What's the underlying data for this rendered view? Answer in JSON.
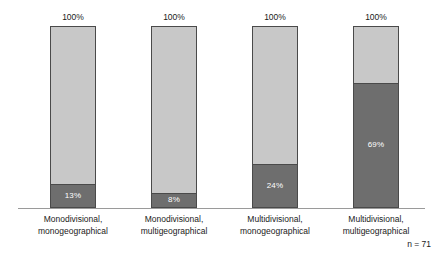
{
  "chart_data": {
    "type": "bar",
    "subtype": "stacked-100-percent",
    "title": "",
    "subtitle": "",
    "xlabel": "",
    "ylabel": "",
    "ylim": [
      0,
      100
    ],
    "grid": false,
    "legend": false,
    "legend_position": "none",
    "orientation": "vertical",
    "categories": [
      "Monodivisional, monogeographical",
      "Monodivisional, multigeographical",
      "Multidivisional, monogeographical",
      "Multidivisional, multigeographical"
    ],
    "category_lines": [
      [
        "Monodivisional,",
        "monogeographical"
      ],
      [
        "Monodivisional,",
        "multigeographical"
      ],
      [
        "Multidivisional,",
        "monogeographical"
      ],
      [
        "Multidivisional,",
        "multigeographical"
      ]
    ],
    "series": [
      {
        "name": "bottom-segment",
        "color": "#6e6e6e",
        "values": [
          13,
          8,
          24,
          69
        ]
      },
      {
        "name": "top-segment",
        "color": "#c8c8c8",
        "values": [
          87,
          92,
          76,
          31
        ]
      }
    ],
    "bottom_labels": [
      "13%",
      "8%",
      "24%",
      "69%"
    ],
    "total_labels": [
      "100%",
      "100%",
      "100%",
      "100%"
    ],
    "totals": [
      100,
      100,
      100,
      100
    ],
    "annotation": "n = 71",
    "sample_size": 71,
    "colors": {
      "segment_dark": "#6e6e6e",
      "segment_light": "#c8c8c8",
      "bar_border": "#4a4a4a",
      "axis_line": "#9a9a9a",
      "background": "#ffffff",
      "text": "#1a1a1a",
      "label_on_bar": "#ffffff"
    }
  },
  "bars": [
    {
      "index": 0,
      "left": 50,
      "total_label": "100%",
      "bottom_label": "13%",
      "bottom_pct": 13,
      "top_pct": 87,
      "label_line1": "Monodivisional,",
      "label_line2": "monogeographical"
    },
    {
      "index": 1,
      "left": 151,
      "total_label": "100%",
      "bottom_label": "8%",
      "bottom_pct": 8,
      "top_pct": 92,
      "label_line1": "Monodivisional,",
      "label_line2": "multigeographical"
    },
    {
      "index": 2,
      "left": 252,
      "total_label": "100%",
      "bottom_label": "24%",
      "bottom_pct": 24,
      "top_pct": 76,
      "label_line1": "Multidivisional,",
      "label_line2": "monogeographical"
    },
    {
      "index": 3,
      "left": 353,
      "total_label": "100%",
      "bottom_label": "69%",
      "bottom_pct": 69,
      "top_pct": 31,
      "label_line1": "Multidivisional,",
      "label_line2": "multigeographical"
    }
  ],
  "footer": {
    "sample_size_label": "n = 71"
  }
}
